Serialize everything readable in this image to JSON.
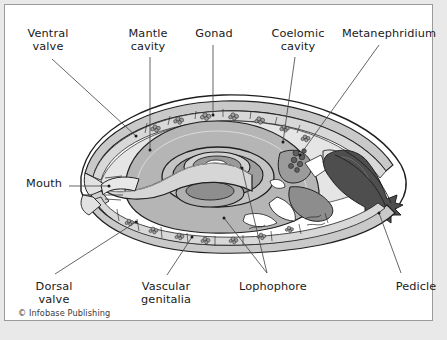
{
  "figure": {
    "copyright": "© Infobase Publishing",
    "frame_color": "#9a9a9a",
    "page_background": "#e9e9e9",
    "canvas_background": "#ffffff",
    "label_color": "#1a1a1a",
    "leader_color": "#4a4a4a"
  },
  "labels": [
    {
      "id": "ventral-valve",
      "text": "Ventral\nvalve",
      "x": 10,
      "y": 22,
      "w": 66
    },
    {
      "id": "mantle-cavity",
      "text": "Mantle\ncavity",
      "x": 111,
      "y": 22,
      "w": 64
    },
    {
      "id": "gonad",
      "text": "Gonad",
      "x": 185,
      "y": 22,
      "w": 48
    },
    {
      "id": "coelomic-cavity",
      "text": "Coelomic\ncavity",
      "x": 258,
      "y": 22,
      "w": 70
    },
    {
      "id": "metanephridium",
      "text": "Metanephridium",
      "x": 333,
      "y": 22,
      "w": 102
    },
    {
      "id": "mouth",
      "text": "Mouth",
      "x": 17,
      "y": 172,
      "w": 44
    },
    {
      "id": "dorsal-valve",
      "text": "Dorsal\nvalve",
      "x": 18,
      "y": 275,
      "w": 62
    },
    {
      "id": "vascular-genitalia",
      "text": "Vascular\ngenitalia",
      "x": 126,
      "y": 275,
      "w": 70
    },
    {
      "id": "lophophore",
      "text": "Lophophore",
      "x": 228,
      "y": 275,
      "w": 80
    },
    {
      "id": "pedicle",
      "text": "Pedicle",
      "x": 385,
      "y": 275,
      "w": 52
    }
  ],
  "leaders": [
    {
      "id": "leader-ventral-valve",
      "path": "M 47,54 L 131,131",
      "dot": [
        131,
        131
      ]
    },
    {
      "id": "leader-mantle-cavity",
      "path": "M 145,52 L 145,145",
      "dot": [
        145,
        145
      ]
    },
    {
      "id": "leader-gonad",
      "path": "M 208,40 L 208,110",
      "dot": [
        208,
        110
      ]
    },
    {
      "id": "leader-coelomic-cavity",
      "path": "M 290,52 L 278,137",
      "dot": [
        278,
        137
      ]
    },
    {
      "id": "leader-metanephridium",
      "path": "M 374,40 L 295,150",
      "dot": [
        295,
        150
      ]
    },
    {
      "id": "leader-mouth",
      "path": "M 64,181 L 104,181",
      "dot": [
        104,
        181
      ]
    },
    {
      "id": "leader-dorsal-valve",
      "path": "M 50,269 L 131,217",
      "dot": [
        131,
        217
      ]
    },
    {
      "id": "leader-vascular-genitalia",
      "path": "M 162,270 L 187,232",
      "dot": [
        187,
        232
      ]
    },
    {
      "id": "leader-lophophore-a",
      "path": "M 262,268 L 237,163",
      "dot": [
        237,
        163
      ]
    },
    {
      "id": "leader-lophophore-b",
      "path": "M 262,268 L 219,213",
      "dot": [
        219,
        213
      ]
    },
    {
      "id": "leader-pedicle",
      "path": "M 396,268 L 374,208",
      "dot": [
        374,
        208
      ]
    }
  ],
  "palette": {
    "shell_light": "#d8d8d8",
    "shell_mid": "#bdbdbd",
    "organ_gray": "#a8a8a8",
    "organ_dark": "#8a8a8a",
    "pedicle_dark": "#4e4e4e",
    "outline": "#1f1f1f",
    "white": "#ffffff"
  }
}
